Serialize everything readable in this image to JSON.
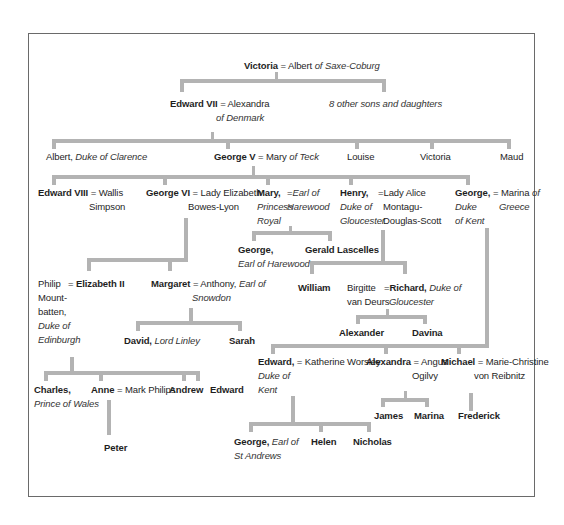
{
  "diagram": {
    "line_color": "#b3b3b3",
    "nodes": {
      "victoria": {
        "name": "Victoria",
        "eq": "=",
        "spouse": "Albert",
        "spouse_title": "of Saxe-Coburg"
      },
      "edward7": {
        "name": "Edward VII",
        "eq": "=",
        "spouse": "Alexandra",
        "spouse_title": "of Denmark"
      },
      "others": {
        "label": "8 other sons and daughters"
      },
      "albert": {
        "name": "Albert,",
        "title": "Duke of Clarence"
      },
      "george5": {
        "name": "George V",
        "eq": "=",
        "spouse": "Mary",
        "spouse_title": "of Teck"
      },
      "louise": {
        "name": "Louise"
      },
      "victoria2": {
        "name": "Victoria"
      },
      "maud": {
        "name": "Maud"
      },
      "edward8": {
        "name": "Edward VIII",
        "eq": "=",
        "spouse_l1": "Wallis",
        "spouse_l2": "Simpson"
      },
      "george6": {
        "name": "George VI",
        "eq": "=",
        "spouse_l1": "Lady Elizabeth",
        "spouse_l2": "Bowes-Lyon"
      },
      "mary": {
        "name": "Mary,",
        "title_l1": "Princess",
        "title_l2": "Royal",
        "eq": "=",
        "spouse_l1": "Earl of",
        "spouse_l2": "Harewood"
      },
      "henry": {
        "name": "Henry,",
        "title_l1": "Duke of",
        "title_l2": "Gloucester",
        "eq": "=",
        "spouse_l1": "Lady Alice",
        "spouse_l2": "Montagu-",
        "spouse_l3": "Douglas-Scott"
      },
      "georgekent": {
        "name": "George,",
        "title_l1": "Duke",
        "title_l2": "of Kent",
        "eq": "=",
        "spouse_l1": "Marina",
        "spouse_l1_i": "of",
        "spouse_l2": "Greece"
      },
      "georgeharewood": {
        "name": "George,",
        "title": "Earl of Harewood"
      },
      "gerald": {
        "name": "Gerald Lascelles"
      },
      "philip": {
        "l1": "Philip",
        "l2": "Mount-",
        "l3": "batten,",
        "title_l1": "Duke of",
        "title_l2": "Edinburgh",
        "eq": "="
      },
      "elizabeth2": {
        "name": "Elizabeth II"
      },
      "margaret": {
        "name": "Margaret",
        "eq": "=",
        "spouse": "Anthony,",
        "spouse_title_l1": "Earl of",
        "spouse_title_l2": "Snowdon"
      },
      "william": {
        "name": "William"
      },
      "birgitte": {
        "l1": "Birgitte",
        "l2": "van Deurs"
      },
      "richard": {
        "eq": "=",
        "name": "Richard,",
        "title_l1": "Duke of",
        "title_l2": "Gloucester"
      },
      "david": {
        "name": "David,",
        "title": "Lord Linley"
      },
      "sarah": {
        "name": "Sarah"
      },
      "alexander": {
        "name": "Alexander"
      },
      "davina": {
        "name": "Davina"
      },
      "edwardkent": {
        "name": "Edward,",
        "title_l1": "Duke of",
        "title_l2": "Kent",
        "eq": "=",
        "spouse": "Katherine Worsley"
      },
      "alexandra": {
        "name": "Alexandra",
        "eq": "=",
        "spouse_l1": "Angus",
        "spouse_l2": "Ogilvy"
      },
      "michael": {
        "name": "Michael",
        "eq": "=",
        "spouse_l1": "Marie-Christine",
        "spouse_l2": "von Reibnitz"
      },
      "charles": {
        "name": "Charles,",
        "title": "Prince of Wales"
      },
      "anne": {
        "name": "Anne",
        "eq": "=",
        "spouse": "Mark Philips"
      },
      "andrew": {
        "name": "Andrew"
      },
      "edward": {
        "name": "Edward"
      },
      "james": {
        "name": "James"
      },
      "marina": {
        "name": "Marina"
      },
      "frederick": {
        "name": "Frederick"
      },
      "peter": {
        "name": "Peter"
      },
      "georgestandrews": {
        "name": "George,",
        "title_l1": "Earl of",
        "title_l2": "St Andrews"
      },
      "helen": {
        "name": "Helen"
      },
      "nicholas": {
        "name": "Nicholas"
      }
    }
  }
}
